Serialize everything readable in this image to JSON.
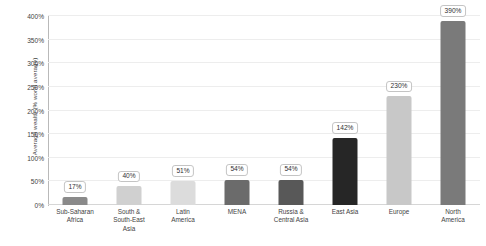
{
  "chart_data": {
    "type": "bar",
    "title": "",
    "subtitle": "",
    "xlabel": "",
    "ylabel": "Average wealth (% world average)",
    "ylim": [
      0,
      400
    ],
    "ytick_step": 50,
    "grid": true,
    "legend": "none",
    "unit": "%",
    "categories": [
      "Sub-Saharan Africa",
      "South & South-East Asia",
      "Latin America",
      "MENA",
      "Russia & Central Asia",
      "East Asia",
      "Europe",
      "North America"
    ],
    "category_lines": [
      [
        "Sub-Saharan",
        "Africa"
      ],
      [
        "South &",
        "South-East",
        "Asia"
      ],
      [
        "Latin",
        "America"
      ],
      [
        "MENA"
      ],
      [
        "Russia &",
        "Central Asia"
      ],
      [
        "East Asia"
      ],
      [
        "Europe"
      ],
      [
        "North",
        "America"
      ]
    ],
    "values": [
      17,
      40,
      51,
      54,
      54,
      142,
      230,
      390
    ],
    "value_labels": [
      "17%",
      "40%",
      "51%",
      "54%",
      "54%",
      "142%",
      "230%",
      "390%"
    ],
    "bar_colors": [
      "#8a8a8a",
      "#d0d0d0",
      "#dcdcdc",
      "#6b6b6b",
      "#585858",
      "#262626",
      "#c8c8c8",
      "#7a7a7a"
    ],
    "ytick_labels": [
      "0%",
      "50%",
      "100%",
      "150%",
      "200%",
      "250%",
      "300%",
      "350%",
      "400%"
    ],
    "ytick_values": [
      0,
      50,
      100,
      150,
      200,
      250,
      300,
      350,
      400
    ],
    "axis_color": "#b9b9b9",
    "gridline_color": "#ededed",
    "label_box_border": "#c4c4c4",
    "text_color": "#3f3f3f"
  }
}
